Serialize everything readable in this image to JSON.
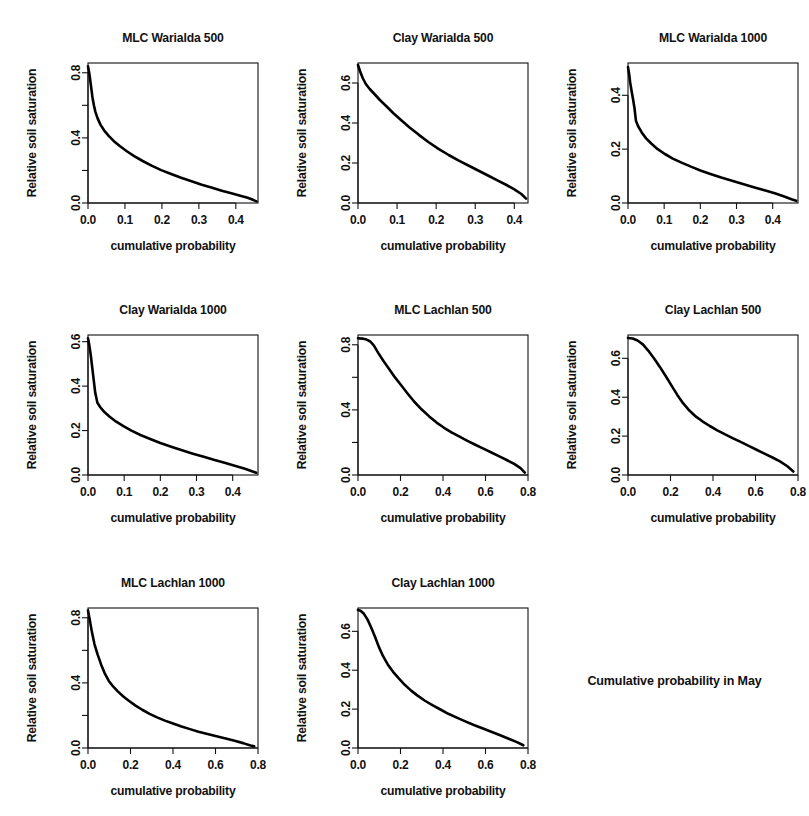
{
  "figure": {
    "caption": "Cumulative probability in May",
    "x_axis_label": "cumulative probability",
    "y_axis_label": "Relative soil saturation",
    "background": "#ffffff",
    "line_color": "#000000",
    "grid_rows": 3,
    "grid_cols": 3
  },
  "chart_data": [
    {
      "type": "line",
      "title": "MLC Warialda 500",
      "xlabel": "cumulative probability",
      "ylabel": "Relative soil saturation",
      "xlim": [
        0.0,
        0.46
      ],
      "ylim": [
        0.0,
        0.86
      ],
      "xticks": [
        0.0,
        0.1,
        0.2,
        0.3,
        0.4
      ],
      "xtick_labels": [
        "0.0",
        "0.1",
        "0.2",
        "0.3",
        "0.4"
      ],
      "yticks": [
        0.0,
        0.2,
        0.4,
        0.6,
        0.8
      ],
      "ytick_labels": [
        "0.0",
        "",
        "0.4",
        "",
        "0.8"
      ],
      "grid": false,
      "legend": "none",
      "x": [
        0.0,
        0.004,
        0.008,
        0.012,
        0.016,
        0.02,
        0.026,
        0.034,
        0.044,
        0.056,
        0.07,
        0.086,
        0.105,
        0.125,
        0.148,
        0.172,
        0.198,
        0.225,
        0.252,
        0.28,
        0.308,
        0.336,
        0.362,
        0.388,
        0.412,
        0.432,
        0.448,
        0.456
      ],
      "y": [
        0.84,
        0.79,
        0.72,
        0.65,
        0.6,
        0.56,
        0.52,
        0.48,
        0.445,
        0.412,
        0.38,
        0.35,
        0.318,
        0.288,
        0.258,
        0.23,
        0.202,
        0.178,
        0.155,
        0.133,
        0.112,
        0.093,
        0.076,
        0.06,
        0.045,
        0.032,
        0.018,
        0.01
      ]
    },
    {
      "type": "line",
      "title": "Clay Warialda 500",
      "xlabel": "cumulative probability",
      "ylabel": "Relative soil saturation",
      "xlim": [
        0.0,
        0.435
      ],
      "ylim": [
        0.0,
        0.7
      ],
      "xticks": [
        0.0,
        0.1,
        0.2,
        0.3,
        0.4
      ],
      "xtick_labels": [
        "0.0",
        "0.1",
        "0.2",
        "0.3",
        "0.4"
      ],
      "yticks": [
        0.0,
        0.2,
        0.4,
        0.6
      ],
      "ytick_labels": [
        "0.0",
        "0.2",
        "0.4",
        "0.6"
      ],
      "grid": false,
      "legend": "none",
      "x": [
        0.0,
        0.005,
        0.012,
        0.02,
        0.03,
        0.042,
        0.056,
        0.072,
        0.09,
        0.11,
        0.132,
        0.155,
        0.18,
        0.205,
        0.232,
        0.258,
        0.285,
        0.31,
        0.335,
        0.358,
        0.38,
        0.4,
        0.418,
        0.43
      ],
      "y": [
        0.69,
        0.66,
        0.625,
        0.595,
        0.57,
        0.545,
        0.515,
        0.485,
        0.45,
        0.415,
        0.378,
        0.342,
        0.305,
        0.272,
        0.24,
        0.212,
        0.185,
        0.16,
        0.135,
        0.112,
        0.09,
        0.068,
        0.045,
        0.022
      ]
    },
    {
      "type": "line",
      "title": "MLC Warialda 1000",
      "xlabel": "cumulative probability",
      "ylabel": "Relative soil saturation",
      "xlim": [
        0.0,
        0.47
      ],
      "ylim": [
        0.0,
        0.52
      ],
      "xticks": [
        0.0,
        0.1,
        0.2,
        0.3,
        0.4
      ],
      "xtick_labels": [
        "0.0",
        "0.1",
        "0.2",
        "0.3",
        "0.4"
      ],
      "yticks": [
        0.0,
        0.2,
        0.4
      ],
      "ytick_labels": [
        "0.0",
        "0.2",
        "0.4"
      ],
      "grid": false,
      "legend": "none",
      "x": [
        0.0,
        0.003,
        0.006,
        0.01,
        0.014,
        0.018,
        0.022,
        0.028,
        0.038,
        0.05,
        0.065,
        0.082,
        0.102,
        0.124,
        0.148,
        0.174,
        0.202,
        0.23,
        0.26,
        0.29,
        0.32,
        0.35,
        0.38,
        0.408,
        0.432,
        0.452,
        0.465
      ],
      "y": [
        0.505,
        0.48,
        0.448,
        0.415,
        0.385,
        0.352,
        0.305,
        0.285,
        0.262,
        0.24,
        0.22,
        0.2,
        0.182,
        0.165,
        0.15,
        0.135,
        0.12,
        0.107,
        0.094,
        0.082,
        0.07,
        0.058,
        0.046,
        0.035,
        0.024,
        0.014,
        0.008
      ]
    },
    {
      "type": "line",
      "title": "Clay Warialda 1000",
      "xlabel": "cumulative probability",
      "ylabel": "Relative soil saturation",
      "xlim": [
        0.0,
        0.47
      ],
      "ylim": [
        0.0,
        0.63
      ],
      "xticks": [
        0.0,
        0.1,
        0.2,
        0.3,
        0.4
      ],
      "xtick_labels": [
        "0.0",
        "0.1",
        "0.2",
        "0.3",
        "0.4"
      ],
      "yticks": [
        0.0,
        0.2,
        0.4,
        0.6
      ],
      "ytick_labels": [
        "0.0",
        "0.2",
        "0.4",
        "0.6"
      ],
      "grid": false,
      "legend": "none",
      "x": [
        0.0,
        0.004,
        0.008,
        0.012,
        0.016,
        0.02,
        0.026,
        0.034,
        0.046,
        0.06,
        0.078,
        0.098,
        0.12,
        0.145,
        0.172,
        0.2,
        0.23,
        0.26,
        0.29,
        0.32,
        0.35,
        0.38,
        0.408,
        0.434,
        0.455,
        0.465
      ],
      "y": [
        0.615,
        0.58,
        0.535,
        0.48,
        0.425,
        0.37,
        0.325,
        0.305,
        0.282,
        0.262,
        0.24,
        0.22,
        0.2,
        0.18,
        0.162,
        0.144,
        0.127,
        0.111,
        0.096,
        0.082,
        0.068,
        0.054,
        0.041,
        0.028,
        0.016,
        0.01
      ]
    },
    {
      "type": "line",
      "title": "MLC Lachlan 500",
      "xlabel": "cumulative probability",
      "ylabel": "Relative soil saturation",
      "xlim": [
        0.0,
        0.8
      ],
      "ylim": [
        0.0,
        0.86
      ],
      "xticks": [
        0.0,
        0.2,
        0.4,
        0.6,
        0.8
      ],
      "xtick_labels": [
        "0.0",
        "0.2",
        "0.4",
        "0.6",
        "0.8"
      ],
      "yticks": [
        0.0,
        0.2,
        0.4,
        0.6,
        0.8
      ],
      "ytick_labels": [
        "0.0",
        "",
        "0.4",
        "",
        "0.8"
      ],
      "grid": false,
      "legend": "none",
      "x": [
        0.0,
        0.02,
        0.04,
        0.058,
        0.075,
        0.095,
        0.12,
        0.148,
        0.175,
        0.205,
        0.235,
        0.265,
        0.3,
        0.335,
        0.37,
        0.405,
        0.44,
        0.478,
        0.515,
        0.552,
        0.59,
        0.628,
        0.665,
        0.7,
        0.735,
        0.765,
        0.785
      ],
      "y": [
        0.84,
        0.838,
        0.832,
        0.82,
        0.795,
        0.75,
        0.7,
        0.648,
        0.598,
        0.548,
        0.498,
        0.45,
        0.402,
        0.36,
        0.322,
        0.29,
        0.262,
        0.236,
        0.21,
        0.186,
        0.162,
        0.138,
        0.114,
        0.092,
        0.068,
        0.042,
        0.015
      ]
    },
    {
      "type": "line",
      "title": "Clay Lachlan 500",
      "xlabel": "cumulative probability",
      "ylabel": "Relative soil saturation",
      "xlim": [
        0.0,
        0.8
      ],
      "ylim": [
        0.0,
        0.72
      ],
      "xticks": [
        0.0,
        0.2,
        0.4,
        0.6,
        0.8
      ],
      "xtick_labels": [
        "0.0",
        "0.2",
        "0.4",
        "0.6",
        "0.8"
      ],
      "yticks": [
        0.0,
        0.2,
        0.4,
        0.6
      ],
      "ytick_labels": [
        "0.0",
        "0.2",
        "0.4",
        "0.6"
      ],
      "grid": false,
      "legend": "none",
      "x": [
        0.0,
        0.022,
        0.045,
        0.07,
        0.095,
        0.122,
        0.15,
        0.178,
        0.205,
        0.232,
        0.26,
        0.29,
        0.32,
        0.352,
        0.385,
        0.42,
        0.455,
        0.492,
        0.53,
        0.568,
        0.605,
        0.642,
        0.68,
        0.715,
        0.75,
        0.778
      ],
      "y": [
        0.705,
        0.702,
        0.692,
        0.672,
        0.64,
        0.6,
        0.556,
        0.508,
        0.46,
        0.412,
        0.368,
        0.33,
        0.3,
        0.275,
        0.252,
        0.23,
        0.21,
        0.19,
        0.17,
        0.15,
        0.13,
        0.11,
        0.09,
        0.07,
        0.045,
        0.018
      ]
    },
    {
      "type": "line",
      "title": "MLC Lachlan 1000",
      "xlabel": "cumulative probability",
      "ylabel": "Relative soil saturation",
      "xlim": [
        0.0,
        0.8
      ],
      "ylim": [
        0.0,
        0.86
      ],
      "xticks": [
        0.0,
        0.2,
        0.4,
        0.6,
        0.8
      ],
      "xtick_labels": [
        "0.0",
        "0.2",
        "0.4",
        "0.6",
        "0.8"
      ],
      "yticks": [
        0.0,
        0.2,
        0.4,
        0.6,
        0.8
      ],
      "ytick_labels": [
        "0.0",
        "",
        "0.4",
        "",
        "0.8"
      ],
      "grid": false,
      "legend": "none",
      "x": [
        0.0,
        0.008,
        0.018,
        0.03,
        0.045,
        0.062,
        0.08,
        0.098,
        0.118,
        0.14,
        0.165,
        0.192,
        0.222,
        0.255,
        0.29,
        0.325,
        0.362,
        0.4,
        0.44,
        0.48,
        0.52,
        0.562,
        0.605,
        0.648,
        0.69,
        0.73,
        0.765,
        0.782
      ],
      "y": [
        0.845,
        0.79,
        0.715,
        0.64,
        0.575,
        0.512,
        0.455,
        0.412,
        0.378,
        0.348,
        0.318,
        0.29,
        0.262,
        0.235,
        0.21,
        0.188,
        0.168,
        0.15,
        0.132,
        0.116,
        0.1,
        0.086,
        0.072,
        0.058,
        0.044,
        0.03,
        0.016,
        0.01
      ]
    },
    {
      "type": "line",
      "title": "Clay Lachlan 1000",
      "xlabel": "cumulative probability",
      "ylabel": "Relative soil saturation",
      "xlim": [
        0.0,
        0.8
      ],
      "ylim": [
        0.0,
        0.72
      ],
      "xticks": [
        0.0,
        0.2,
        0.4,
        0.6,
        0.8
      ],
      "xtick_labels": [
        "0.0",
        "0.2",
        "0.4",
        "0.6",
        "0.8"
      ],
      "yticks": [
        0.0,
        0.2,
        0.4,
        0.6
      ],
      "ytick_labels": [
        "0.0",
        "0.2",
        "0.4",
        "0.6"
      ],
      "grid": false,
      "legend": "none",
      "x": [
        0.0,
        0.012,
        0.028,
        0.045,
        0.062,
        0.08,
        0.098,
        0.118,
        0.14,
        0.165,
        0.192,
        0.22,
        0.25,
        0.282,
        0.315,
        0.35,
        0.388,
        0.425,
        0.465,
        0.505,
        0.545,
        0.588,
        0.63,
        0.672,
        0.712,
        0.748,
        0.778
      ],
      "y": [
        0.71,
        0.706,
        0.69,
        0.66,
        0.62,
        0.572,
        0.52,
        0.472,
        0.43,
        0.392,
        0.358,
        0.325,
        0.295,
        0.268,
        0.243,
        0.22,
        0.198,
        0.176,
        0.156,
        0.137,
        0.118,
        0.1,
        0.082,
        0.064,
        0.046,
        0.03,
        0.014
      ]
    }
  ]
}
